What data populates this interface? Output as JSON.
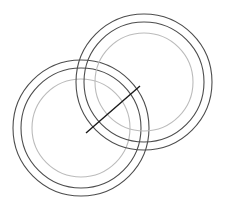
{
  "figure": {
    "title": "",
    "background_color": "#ffffff",
    "width": 226,
    "height": 216
  },
  "chart_data": {
    "type": "scatter",
    "title": "",
    "subtitle": "",
    "xlabel": "",
    "ylabel": "",
    "xlim": [
      0,
      226
    ],
    "ylim": [
      0,
      216
    ],
    "grid": false,
    "legend": null,
    "annotations": [],
    "shapes": [
      {
        "name": "left-group-outer-ring",
        "kind": "circle",
        "cx": 81,
        "cy": 128,
        "r": 68,
        "stroke": "#4d4d4d",
        "stroke_width": 1.1,
        "fill": "none"
      },
      {
        "name": "left-group-middle-ring",
        "kind": "circle",
        "cx": 81,
        "cy": 128,
        "r": 60,
        "stroke": "#4d4d4d",
        "stroke_width": 1.1,
        "fill": "none"
      },
      {
        "name": "left-group-inner-ring",
        "kind": "circle",
        "cx": 81,
        "cy": 128,
        "r": 49,
        "stroke": "#bbbbbb",
        "stroke_width": 1.1,
        "fill": "none"
      },
      {
        "name": "right-group-outer-ring",
        "kind": "circle",
        "cx": 144,
        "cy": 82,
        "r": 68,
        "stroke": "#4d4d4d",
        "stroke_width": 1.1,
        "fill": "none"
      },
      {
        "name": "right-group-middle-ring",
        "kind": "circle",
        "cx": 144,
        "cy": 82,
        "r": 60,
        "stroke": "#4d4d4d",
        "stroke_width": 1.1,
        "fill": "none"
      },
      {
        "name": "right-group-inner-ring",
        "kind": "circle",
        "cx": 144,
        "cy": 82,
        "r": 49,
        "stroke": "#bbbbbb",
        "stroke_width": 1.1,
        "fill": "none"
      },
      {
        "name": "diagonal-line-segment",
        "kind": "line",
        "x1": 86,
        "y1": 133,
        "x2": 140,
        "y2": 86,
        "stroke": "#1a1a1a",
        "stroke_width": 1.4
      }
    ]
  }
}
